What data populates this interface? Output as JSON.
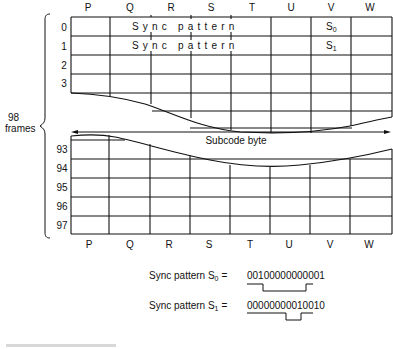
{
  "diagram": {
    "columns": [
      "P",
      "Q",
      "R",
      "S",
      "T",
      "U",
      "V",
      "W"
    ],
    "top_rows": [
      "0",
      "1",
      "2",
      "3"
    ],
    "bottom_rows": [
      "93",
      "94",
      "95",
      "96",
      "97"
    ],
    "sync_text_row0": "Sync pattern",
    "sync_text_row1": "Sync pattern",
    "v_cell_row0": "S",
    "v_cell_row0_sub": "0",
    "v_cell_row1": "S",
    "v_cell_row1_sub": "1",
    "brace_label_line1": "98",
    "brace_label_line2": "frames",
    "arrow_label": "Subcode byte"
  },
  "sync_patterns": [
    {
      "label": "Sync pattern S",
      "sub": "0",
      "equals": "=",
      "bits": "00100000000001"
    },
    {
      "label": "Sync pattern S",
      "sub": "1",
      "equals": "=",
      "bits": "00000000010010"
    }
  ],
  "caption": ""
}
